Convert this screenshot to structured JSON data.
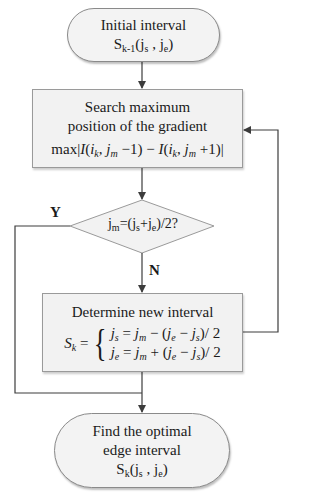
{
  "colors": {
    "line": "#3c3c3c",
    "fill": "#f2f2f2",
    "border": "#8a8a8a"
  },
  "nodes": {
    "start": {
      "type": "terminal",
      "line1": "Initial interval",
      "symbol": "S",
      "symbol_sub": "k-1",
      "args": "(j",
      "arg1_sub": "s",
      "sep": " , j",
      "arg2_sub": "e",
      "close": ")"
    },
    "search": {
      "type": "process",
      "line1": "Search maximum",
      "line2": "position of the gradient",
      "formula": "max|I(i_k, j_m − 1) − I(i_k, j_m + 1)|"
    },
    "decision": {
      "type": "decision",
      "text": "jm=(js+je)/2?",
      "yes_label": "Y",
      "no_label": "N"
    },
    "determine": {
      "type": "process",
      "line1": "Determine new interval",
      "lhs": "S_k =",
      "case1": "j_s = j_m − (j_e − j_s)/2",
      "case2": "j_e = j_m + (j_e − j_s)/2"
    },
    "end": {
      "type": "terminal",
      "line1": "Find the optimal",
      "line2": "edge interval",
      "symbol": "S",
      "symbol_sub": "k",
      "args": "(j",
      "arg1_sub": "s",
      "sep": " , j",
      "arg2_sub": "e",
      "close": ")"
    }
  },
  "edges": [
    {
      "from": "start",
      "to": "search"
    },
    {
      "from": "search",
      "to": "decision"
    },
    {
      "from": "decision",
      "to": "determine",
      "label": "N"
    },
    {
      "from": "decision",
      "to": "end",
      "label": "Y"
    },
    {
      "from": "determine",
      "to": "search",
      "label": "loop"
    }
  ]
}
